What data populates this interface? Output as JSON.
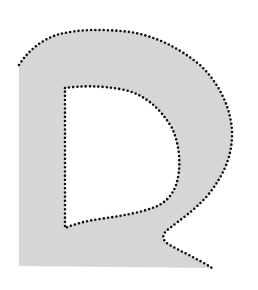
{
  "image": {
    "description": "Gray letter-shaped region with a black dotted contour outlining its outer boundary and inner hole",
    "width": 258,
    "height": 290,
    "background_color": "#ffffff",
    "fill_color": "#d6d6d6",
    "contour_color": "#111111"
  },
  "shape": {
    "fill_outline": "M19,65 C30,48 45,38 60,34 C80,29 105,29 130,32 C155,36 178,47 200,65 C218,82 230,105 232,130 C233,155 224,175 208,195 C195,210 180,220 170,228 C163,233 160,238 168,244 C182,252 200,260 212,268 L19,266 Z",
    "hole_outline": "M65,88 C80,86 100,85 125,90 C145,95 160,108 172,128 C181,148 181,170 176,185 C172,196 165,203 155,207 C140,213 120,216 100,219 C85,221 75,224 65,228 Z",
    "outer_contour": "M19,65 C30,48 45,38 60,34 C80,29 105,29 130,32 C155,36 178,47 200,65 C218,82 230,105 232,130 C233,155 224,175 208,195 C195,210 180,220 170,228 C163,233 160,238 168,244 C182,252 200,260 212,268",
    "inner_contour": "M65,88 C80,86 100,85 125,90 C145,95 160,108 172,128 C181,148 181,170 176,185 C172,196 165,203 155,207 C140,213 120,216 100,219 C85,221 75,224 65,228 Z"
  }
}
